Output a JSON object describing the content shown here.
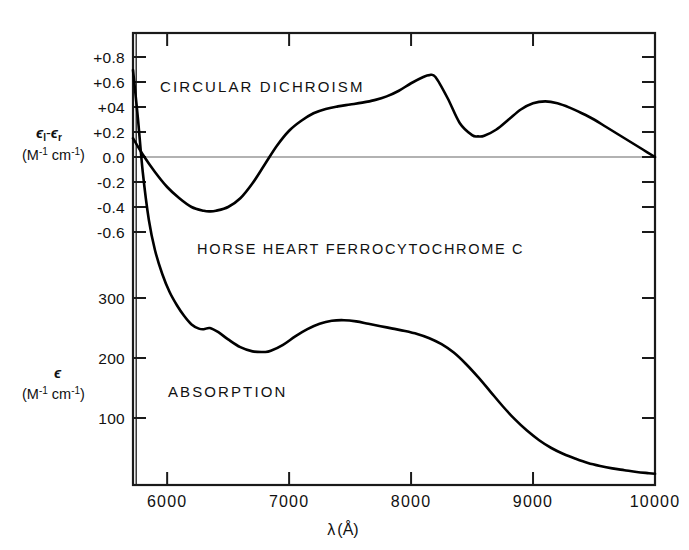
{
  "figure": {
    "title": "HORSE HEART FERROCYTOCHROME C",
    "background_color": "#ffffff",
    "line_color": "#000000",
    "axis_color": "#1a1a1a",
    "zero_line_color": "#555555"
  },
  "labels": {
    "circular_dichroism": "CIRCULAR  DICHROISM",
    "absorption": "ABSORPTION",
    "cd_axis_main": "ϵ",
    "cd_axis_sub_l": "l",
    "cd_axis_minus": "-",
    "cd_axis_main2": "ϵ",
    "cd_axis_sub_r": "r",
    "cd_axis_units": "(M",
    "cd_axis_units_sup1": "-1",
    "cd_axis_units_mid": " cm",
    "cd_axis_units_sup2": "-1",
    "cd_axis_units_end": ")",
    "abs_axis_main": "ϵ",
    "abs_axis_units": "(M",
    "abs_axis_units_sup1": "-1",
    "abs_axis_units_mid": " cm",
    "abs_axis_units_sup2": "-1",
    "abs_axis_units_end": ")",
    "x_axis_title_lambda": "λ",
    "x_axis_title_unit": "(Å)"
  },
  "axes": {
    "x_ticks": [
      "6000",
      "7000",
      "8000",
      "9000",
      "10000"
    ],
    "x_tick_values": [
      6000,
      7000,
      8000,
      9000,
      10000
    ],
    "x_range": [
      5720,
      10000
    ],
    "cd_ticks": [
      "+0.8",
      "+0.6",
      "+04",
      "+0.2",
      "0.0",
      "-0.2",
      "-0.4",
      "-0.6"
    ],
    "cd_tick_values": [
      0.8,
      0.6,
      0.4,
      0.2,
      0.0,
      -0.2,
      -0.4,
      -0.6
    ],
    "abs_ticks": [
      "300",
      "200",
      "100"
    ],
    "abs_tick_values": [
      300,
      200,
      100
    ]
  },
  "chart_data": {
    "type": "line",
    "title": "HORSE HEART FERROCYTOCHROME C",
    "xlabel": "λ(Å)",
    "ylabel": "ϵ_l - ϵ_r (M-1 cm-1)  /  ϵ (M-1 cm-1)",
    "xlim": [
      5720,
      10000
    ],
    "grid": false,
    "legend": "none",
    "series": [
      {
        "name": "CIRCULAR DICHROISM",
        "ylabel": "ϵ_l - ϵ_r (M-1 cm-1)",
        "ylim": [
          -0.75,
          0.95
        ],
        "x": [
          5720,
          5800,
          5900,
          6000,
          6100,
          6200,
          6300,
          6350,
          6400,
          6500,
          6600,
          6700,
          6800,
          6900,
          7000,
          7100,
          7200,
          7300,
          7400,
          7500,
          7600,
          7700,
          7800,
          7900,
          8000,
          8100,
          8150,
          8200,
          8300,
          8400,
          8500,
          8550,
          8600,
          8700,
          8800,
          8900,
          9000,
          9100,
          9200,
          9300,
          9400,
          9500,
          9600,
          9700,
          9800,
          9900,
          10000
        ],
        "y": [
          0.15,
          0.02,
          -0.12,
          -0.24,
          -0.33,
          -0.4,
          -0.43,
          -0.435,
          -0.43,
          -0.4,
          -0.33,
          -0.21,
          -0.06,
          0.09,
          0.21,
          0.29,
          0.35,
          0.385,
          0.405,
          0.42,
          0.435,
          0.455,
          0.485,
          0.53,
          0.59,
          0.64,
          0.655,
          0.64,
          0.47,
          0.27,
          0.175,
          0.165,
          0.17,
          0.22,
          0.3,
          0.38,
          0.43,
          0.445,
          0.43,
          0.395,
          0.35,
          0.3,
          0.24,
          0.18,
          0.12,
          0.06,
          0.0
        ]
      },
      {
        "name": "ABSORPTION",
        "ylabel": "ϵ (M-1 cm-1)",
        "ylim": [
          0,
          680
        ],
        "x": [
          5720,
          5760,
          5800,
          5850,
          5900,
          5960,
          6020,
          6080,
          6140,
          6200,
          6260,
          6300,
          6350,
          6420,
          6500,
          6600,
          6700,
          6800,
          6850,
          6950,
          7050,
          7150,
          7250,
          7350,
          7450,
          7550,
          7650,
          7750,
          7850,
          7950,
          8050,
          8150,
          8250,
          8350,
          8450,
          8550,
          8650,
          8750,
          8850,
          8950,
          9050,
          9150,
          9250,
          9350,
          9450,
          9550,
          9650,
          9750,
          9850,
          9950,
          10000
        ],
        "y": [
          680,
          600,
          510,
          430,
          380,
          340,
          310,
          288,
          270,
          256,
          249,
          248,
          250,
          243,
          231,
          218,
          211,
          210,
          212,
          222,
          236,
          248,
          257,
          262,
          263,
          261,
          257,
          253,
          249,
          245,
          240,
          233,
          223,
          209,
          190,
          168,
          144,
          120,
          98,
          79,
          63,
          50,
          40,
          32,
          25,
          20,
          16,
          13,
          10,
          8,
          7
        ]
      }
    ]
  }
}
